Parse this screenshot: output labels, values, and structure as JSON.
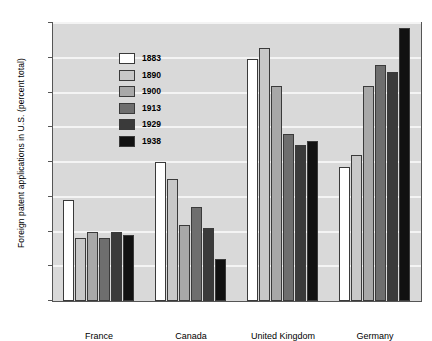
{
  "chart_data": {
    "type": "bar",
    "title": "",
    "xlabel": "",
    "ylabel": "Foreign patent applications in U.S. (percent total)",
    "ylim": [
      0,
      40
    ],
    "yticks": [
      0,
      5,
      10,
      15,
      20,
      25,
      30,
      35,
      40
    ],
    "grid": true,
    "legend_position": "top-left inside plot",
    "categories": [
      "France",
      "Canada",
      "United Kingdom",
      "Germany"
    ],
    "series": [
      {
        "name": "1883",
        "color": "#ffffff",
        "values": [
          14.5,
          20.0,
          34.8,
          19.3
        ]
      },
      {
        "name": "1890",
        "color": "#c8c8c8",
        "values": [
          9.0,
          17.5,
          36.4,
          21.0
        ]
      },
      {
        "name": "1900",
        "color": "#a8a8a8",
        "values": [
          10.0,
          11.0,
          31.0,
          31.0
        ]
      },
      {
        "name": "1913",
        "color": "#6e6e6e",
        "values": [
          9.0,
          13.5,
          24.0,
          34.0
        ]
      },
      {
        "name": "1929",
        "color": "#3a3a3a",
        "values": [
          10.0,
          10.5,
          22.5,
          33.0
        ]
      },
      {
        "name": "1938",
        "color": "#111111",
        "values": [
          9.5,
          6.0,
          23.0,
          39.3
        ]
      }
    ]
  },
  "legend": {
    "items": [
      {
        "label": "1883"
      },
      {
        "label": "1890"
      },
      {
        "label": "1900"
      },
      {
        "label": "1913"
      },
      {
        "label": "1929"
      },
      {
        "label": "1938"
      }
    ]
  },
  "style": {
    "plot_background": "#d9d9d9",
    "gridline_color": "#f4f4f4",
    "axis_color": "#555555",
    "page_background": "#ffffff"
  }
}
